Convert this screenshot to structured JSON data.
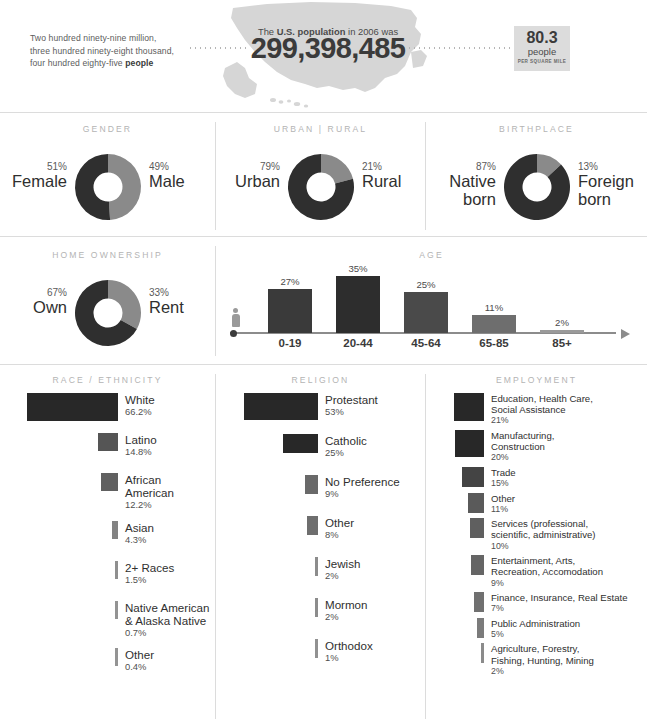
{
  "header": {
    "population_words_line1": "Two hundred ninety-nine million,",
    "population_words_line2": "three hundred ninety-eight thousand,",
    "population_words_line3_pre": "four hundred eighty-five ",
    "population_words_line3_bold": "people",
    "caption_pre": "The ",
    "caption_bold": "U.S. population",
    "caption_post": " in 2006 was",
    "population_number": "299,398,485",
    "density_value": "80.3",
    "density_unit": "people",
    "density_sub": "PER SQUARE MILE"
  },
  "sections": {
    "gender": "GENDER",
    "urban_rural": "URBAN | RURAL",
    "birthplace": "BIRTHPLACE",
    "home_ownership": "HOME OWNERSHIP",
    "age": "AGE",
    "race": "RACE / ETHNICITY",
    "religion": "RELIGION",
    "employment": "EMPLOYMENT"
  },
  "colors": {
    "dark": "#2f2f2f",
    "mid": "#6f6f6f",
    "light_gray": "#9a9a9a",
    "pale": "#c9c9c9",
    "rule": "#dcdcdc",
    "heading": "#b4b4b4",
    "density_box": "#dcdcdc"
  },
  "donuts": [
    {
      "id": "gender",
      "left": {
        "pct": "51%",
        "label": "Female",
        "value": 51,
        "color": "#2f2f2f"
      },
      "right": {
        "pct": "49%",
        "label": "Male",
        "value": 49,
        "color": "#8a8a8a"
      }
    },
    {
      "id": "urban-rural",
      "left": {
        "pct": "79%",
        "label": "Urban",
        "value": 79,
        "color": "#2f2f2f"
      },
      "right": {
        "pct": "21%",
        "label": "Rural",
        "value": 21,
        "color": "#8a8a8a"
      }
    },
    {
      "id": "birthplace",
      "left": {
        "pct": "87%",
        "label": "Native born",
        "value": 87,
        "color": "#2f2f2f"
      },
      "right": {
        "pct": "13%",
        "label": "Foreign born",
        "value": 13,
        "color": "#8a8a8a"
      }
    },
    {
      "id": "home-ownership",
      "left": {
        "pct": "67%",
        "label": "Own",
        "value": 67,
        "color": "#2f2f2f"
      },
      "right": {
        "pct": "33%",
        "label": "Rent",
        "value": 33,
        "color": "#8a8a8a"
      }
    }
  ],
  "chart_data": [
    {
      "type": "bar",
      "id": "age",
      "title": "AGE",
      "categories": [
        "0-19",
        "20-44",
        "45-64",
        "65-85",
        "85+"
      ],
      "values": [
        27,
        35,
        25,
        11,
        2
      ],
      "labels": [
        "27%",
        "35%",
        "25%",
        "11%",
        "2%"
      ],
      "colors": [
        "#3a3a3a",
        "#2d2d2d",
        "#4a4a4a",
        "#6e6e6e",
        "#9a9a9a"
      ],
      "ylabel": "",
      "xlabel": "",
      "ylim": [
        0,
        35
      ],
      "grid": false,
      "legend": false
    },
    {
      "type": "bar",
      "id": "race",
      "title": "RACE / ETHNICITY",
      "orientation": "horizontal",
      "categories": [
        "White",
        "Latino",
        "African American",
        "Asian",
        "2+ Races",
        "Native American & Alaska Native",
        "Other"
      ],
      "values": [
        66.2,
        14.8,
        12.2,
        4.3,
        1.5,
        0.7,
        0.4
      ],
      "labels": [
        "66.2%",
        "14.8%",
        "12.2%",
        "4.3%",
        "1.5%",
        "0.7%",
        "0.4%"
      ],
      "ylabel": "",
      "xlabel": "",
      "grid": false,
      "legend": false
    },
    {
      "type": "bar",
      "id": "religion",
      "title": "RELIGION",
      "orientation": "horizontal",
      "categories": [
        "Protestant",
        "Catholic",
        "No Preference",
        "Other",
        "Jewish",
        "Mormon",
        "Orthodox"
      ],
      "values": [
        53,
        25,
        9,
        8,
        2,
        2,
        1
      ],
      "labels": [
        "53%",
        "25%",
        "9%",
        "8%",
        "2%",
        "2%",
        "1%"
      ],
      "ylabel": "",
      "xlabel": "",
      "grid": false,
      "legend": false
    },
    {
      "type": "bar",
      "id": "employment",
      "title": "EMPLOYMENT",
      "orientation": "horizontal",
      "categories": [
        "Education, Health Care, Social Assistance",
        "Manufacturing, Construction",
        "Trade",
        "Other",
        "Services (professional, scientific, administrative)",
        "Entertainment, Arts, Recreation, Accomodation",
        "Finance, Insurance, Real Estate",
        "Public Administration",
        "Agriculture, Forestry, Fishing, Hunting, Mining"
      ],
      "values": [
        21,
        20,
        15,
        11,
        10,
        9,
        7,
        5,
        2
      ],
      "labels": [
        "21%",
        "20%",
        "15%",
        "11%",
        "10%",
        "9%",
        "7%",
        "5%",
        "2%"
      ],
      "ylabel": "",
      "xlabel": "",
      "grid": false,
      "legend": false
    }
  ],
  "race_items": [
    {
      "label_lines": [
        "White"
      ],
      "pct": "66.2%",
      "value": 66.2
    },
    {
      "label_lines": [
        "Latino"
      ],
      "pct": "14.8%",
      "value": 14.8
    },
    {
      "label_lines": [
        "African",
        "American"
      ],
      "pct": "12.2%",
      "value": 12.2
    },
    {
      "label_lines": [
        "Asian"
      ],
      "pct": "4.3%",
      "value": 4.3
    },
    {
      "label_lines": [
        "2+ Races"
      ],
      "pct": "1.5%",
      "value": 1.5
    },
    {
      "label_lines": [
        "Native American",
        "& Alaska Native"
      ],
      "pct": "0.7%",
      "value": 0.7
    },
    {
      "label_lines": [
        "Other"
      ],
      "pct": "0.4%",
      "value": 0.4
    }
  ],
  "religion_items": [
    {
      "label_lines": [
        "Protestant"
      ],
      "pct": "53%",
      "value": 53
    },
    {
      "label_lines": [
        "Catholic"
      ],
      "pct": "25%",
      "value": 25
    },
    {
      "label_lines": [
        "No Preference"
      ],
      "pct": "9%",
      "value": 9
    },
    {
      "label_lines": [
        "Other"
      ],
      "pct": "8%",
      "value": 8
    },
    {
      "label_lines": [
        "Jewish"
      ],
      "pct": "2%",
      "value": 2
    },
    {
      "label_lines": [
        "Mormon"
      ],
      "pct": "2%",
      "value": 2
    },
    {
      "label_lines": [
        "Orthodox"
      ],
      "pct": "1%",
      "value": 1
    }
  ],
  "employment_items": [
    {
      "label_lines": [
        "Education, Health Care,",
        "Social Assistance"
      ],
      "pct": "21%",
      "value": 21
    },
    {
      "label_lines": [
        "Manufacturing,",
        "Construction"
      ],
      "pct": "20%",
      "value": 20
    },
    {
      "label_lines": [
        "Trade"
      ],
      "pct": "15%",
      "value": 15
    },
    {
      "label_lines": [
        "Other"
      ],
      "pct": "11%",
      "value": 11
    },
    {
      "label_lines": [
        "Services (professional,",
        "scientific, administrative)"
      ],
      "pct": "10%",
      "value": 10
    },
    {
      "label_lines": [
        "Entertainment, Arts,",
        "Recreation, Accomodation"
      ],
      "pct": "9%",
      "value": 9
    },
    {
      "label_lines": [
        "Finance, Insurance, Real Estate"
      ],
      "pct": "7%",
      "value": 7
    },
    {
      "label_lines": [
        "Public Administration"
      ],
      "pct": "5%",
      "value": 5
    },
    {
      "label_lines": [
        "Agriculture, Forestry,",
        "Fishing, Hunting, Mining"
      ],
      "pct": "2%",
      "value": 2
    }
  ]
}
